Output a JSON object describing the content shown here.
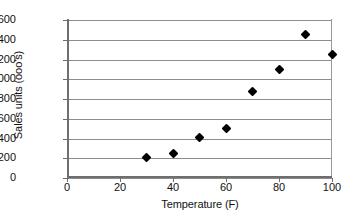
{
  "chart_data": {
    "type": "scatter",
    "title": "",
    "xlabel": "Temperature (F)",
    "ylabel": "Sales units (ooo's)",
    "xlim": [
      0,
      100
    ],
    "ylim": [
      0,
      1600
    ],
    "grid": "horizontal",
    "legend": "none",
    "marker": "black-diamond",
    "x_ticks": [
      "0",
      "20",
      "40",
      "60",
      "80",
      "100"
    ],
    "y_ticks": [
      "0",
      "200",
      "400",
      "600",
      "800",
      "1000",
      "1200",
      "1400",
      "1600"
    ],
    "x": [
      30,
      40,
      50,
      60,
      70,
      80,
      90,
      100
    ],
    "values": [
      205,
      245,
      410,
      500,
      875,
      1100,
      1450,
      1250
    ],
    "points": [
      {
        "x": 30,
        "y": 205
      },
      {
        "x": 40,
        "y": 245
      },
      {
        "x": 50,
        "y": 410
      },
      {
        "x": 60,
        "y": 500
      },
      {
        "x": 70,
        "y": 875
      },
      {
        "x": 80,
        "y": 1100
      },
      {
        "x": 90,
        "y": 1450
      },
      {
        "x": 100,
        "y": 1250
      }
    ]
  },
  "colors": {
    "marker": "#000000",
    "gridline": "#8c8c8c",
    "axis": "#6e6e6e",
    "background": "#ffffff",
    "text": "#111111"
  }
}
